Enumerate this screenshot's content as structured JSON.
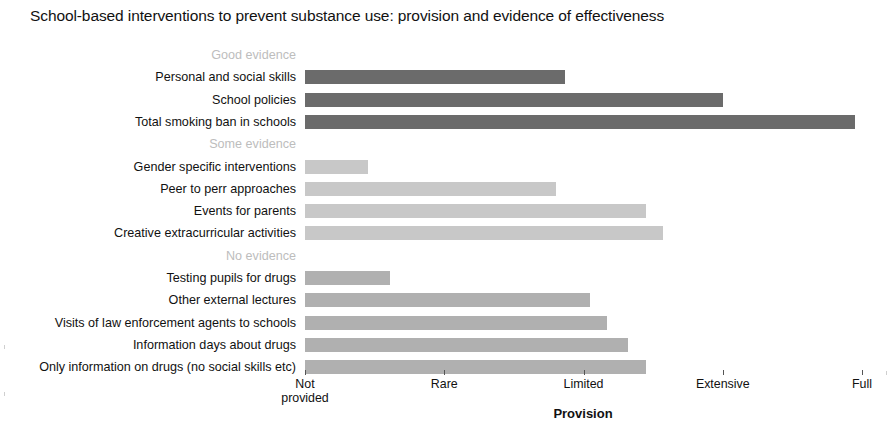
{
  "chart_data": {
    "type": "bar",
    "orientation": "horizontal",
    "title": "School-based interventions to prevent substance use: provision and evidence of effectiveness",
    "xlabel": "Provision",
    "ylabel": "",
    "xlim": [
      0,
      4
    ],
    "grid": false,
    "legend": "none",
    "xtick_values": [
      0,
      1,
      2,
      3,
      4
    ],
    "xtick_labels": [
      "Not\nprovided",
      "Rare",
      "Limited",
      "Extensive",
      "Full"
    ],
    "groups": [
      {
        "name": "Good evidence",
        "color": "#6b6b6b",
        "categories": [
          "Personal and social skills",
          "School policies",
          "Total smoking ban in schools"
        ],
        "values": [
          1.87,
          3.0,
          3.95
        ]
      },
      {
        "name": "Some evidence",
        "color": "#c8c8c8",
        "categories": [
          "Gender specific interventions",
          "Peer to perr approaches",
          "Events for parents",
          "Creative extracurricular activities"
        ],
        "values": [
          0.45,
          1.8,
          2.45,
          2.57
        ]
      },
      {
        "name": "No evidence",
        "color": "#b0b0b0",
        "categories": [
          "Testing pupils for drugs",
          "Other external lectures",
          "Visits of law enforcement agents to schools",
          "Information days about drugs",
          "Only information on drugs (no social skills etc)"
        ],
        "values": [
          0.61,
          2.05,
          2.17,
          2.32,
          2.45
        ]
      }
    ],
    "rows": [
      {
        "label": "Good evidence",
        "type": "group-header",
        "value": null,
        "color": "#bdbdbd"
      },
      {
        "label": "Personal and social skills",
        "type": "bar",
        "value": 1.87,
        "color": "#6b6b6b"
      },
      {
        "label": "School policies",
        "type": "bar",
        "value": 3.0,
        "color": "#6b6b6b"
      },
      {
        "label": "Total smoking ban in schools",
        "type": "bar",
        "value": 3.95,
        "color": "#6b6b6b"
      },
      {
        "label": "Some evidence",
        "type": "group-header",
        "value": null,
        "color": "#bdbdbd"
      },
      {
        "label": "Gender specific interventions",
        "type": "bar",
        "value": 0.45,
        "color": "#c8c8c8"
      },
      {
        "label": "Peer to perr approaches",
        "type": "bar",
        "value": 1.8,
        "color": "#c8c8c8"
      },
      {
        "label": "Events for parents",
        "type": "bar",
        "value": 2.45,
        "color": "#c8c8c8"
      },
      {
        "label": "Creative extracurricular activities",
        "type": "bar",
        "value": 2.57,
        "color": "#c8c8c8"
      },
      {
        "label": "No evidence",
        "type": "group-header",
        "value": null,
        "color": "#bdbdbd"
      },
      {
        "label": "Testing pupils for drugs",
        "type": "bar",
        "value": 0.61,
        "color": "#b0b0b0"
      },
      {
        "label": "Other external lectures",
        "type": "bar",
        "value": 2.05,
        "color": "#b0b0b0"
      },
      {
        "label": "Visits of law enforcement agents to schools",
        "type": "bar",
        "value": 2.17,
        "color": "#b0b0b0"
      },
      {
        "label": "Information days about drugs",
        "type": "bar",
        "value": 2.32,
        "color": "#b0b0b0"
      },
      {
        "label": "Only information on drugs (no social skills etc)",
        "type": "bar",
        "value": 2.45,
        "color": "#b0b0b0"
      }
    ]
  }
}
